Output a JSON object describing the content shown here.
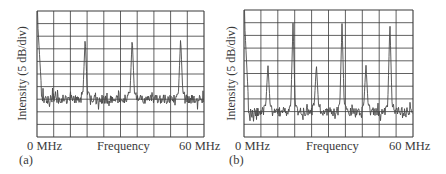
{
  "chart_data": [
    {
      "panel": "(a)",
      "type": "line",
      "title": "",
      "xlabel": "Frequency",
      "ylabel": "Intensity (5 dB/div)",
      "x_tick_labels": [
        "0 MHz",
        "60 MHz"
      ],
      "xlim": [
        0,
        60
      ],
      "grid": true,
      "grid_divisions": {
        "x": 10,
        "y": 10
      },
      "y_unit_per_div_dB": 5,
      "noise_floor_div_from_top": 7,
      "peaks": [
        {
          "freq_MHz": 0,
          "height_div_from_top": 0,
          "note": "DC edge"
        },
        {
          "freq_MHz": 17.3,
          "height_div_from_top": 2.1
        },
        {
          "freq_MHz": 34.2,
          "height_div_from_top": 2.1
        },
        {
          "freq_MHz": 51.6,
          "height_div_from_top": 2.1
        }
      ]
    },
    {
      "panel": "(b)",
      "type": "line",
      "title": "",
      "xlabel": "Frequency",
      "ylabel": "Intensity (5 dB/div)",
      "x_tick_labels": [
        "0 MHz",
        "60 MHz"
      ],
      "xlim": [
        0,
        60
      ],
      "grid": true,
      "grid_divisions": {
        "x": 10,
        "y": 10
      },
      "y_unit_per_div_dB": 5,
      "noise_floor_div_from_top": 8,
      "peaks": [
        {
          "freq_MHz": 0,
          "height_div_from_top": 0,
          "note": "DC edge"
        },
        {
          "freq_MHz": 8.5,
          "height_div_from_top": 4.3
        },
        {
          "freq_MHz": 17.4,
          "height_div_from_top": 1.0
        },
        {
          "freq_MHz": 25.7,
          "height_div_from_top": 4.3
        },
        {
          "freq_MHz": 34.8,
          "height_div_from_top": 1.0
        },
        {
          "freq_MHz": 43.3,
          "height_div_from_top": 4.3
        },
        {
          "freq_MHz": 51.8,
          "height_div_from_top": 1.0
        }
      ]
    }
  ],
  "panels": {
    "a": {
      "label": "(a)",
      "ylabel": "Intensity (5 dB/div)",
      "xlabel": "Frequency",
      "x_min_label": "0 MHz",
      "x_max_label": "60 MHz"
    },
    "b": {
      "label": "(b)",
      "ylabel": "Intensity (5 dB/div)",
      "xlabel": "Frequency",
      "x_min_label": "0 MHz",
      "x_max_label": "60 MHz"
    }
  },
  "colors": {
    "grid": "#3a3a3a",
    "trace": "#4a4a4a",
    "background": "#ffffff"
  }
}
